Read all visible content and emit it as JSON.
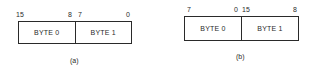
{
  "figures": [
    {
      "id": "a",
      "caption": "(a)",
      "bit_labels": {
        "left_high": "15",
        "left_low": "8",
        "right_high": "7",
        "right_low": "0"
      },
      "cells": [
        "BYTE 0",
        "BYTE 1"
      ]
    },
    {
      "id": "b",
      "caption": "(b)",
      "bit_labels": {
        "left_high": "7",
        "left_low": "0",
        "right_high": "15",
        "right_low": "8"
      },
      "cells": [
        "BYTE 0",
        "BYTE 1"
      ]
    }
  ],
  "colors": {
    "line": "#2a2a2a",
    "background": "#ffffff"
  }
}
